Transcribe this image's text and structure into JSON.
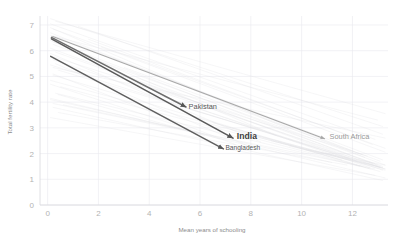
{
  "chart_data": {
    "type": "line",
    "title": "",
    "subtitle": "",
    "xlabel": "Mean years of schooling",
    "ylabel": "Total fertility rate",
    "xlim": [
      -0.3,
      13.4
    ],
    "ylim": [
      0,
      7.35
    ],
    "xticks": [
      0,
      2,
      4,
      6,
      8,
      10,
      12
    ],
    "xtick_labels": [
      "0",
      "2",
      "4",
      "6",
      "8",
      "10",
      "12"
    ],
    "yticks": [
      0,
      1,
      2,
      3,
      4,
      5,
      6,
      7
    ],
    "ytick_labels": [
      "0",
      "1",
      "2",
      "3",
      "4",
      "5",
      "6",
      "7"
    ],
    "grid": true,
    "legend_position": "none",
    "annotations": [
      {
        "text": "Pakistan",
        "x": 5.55,
        "y": 3.75,
        "style": "normal"
      },
      {
        "text": "India",
        "x": 7.45,
        "y": 2.55,
        "style": "strong"
      },
      {
        "text": "Bangladesh",
        "x": 7.0,
        "y": 2.12,
        "style": "small"
      },
      {
        "text": "South Africa",
        "x": 11.1,
        "y": 2.55,
        "style": "faint"
      }
    ],
    "series": [
      {
        "name": "Pakistan",
        "color": "#6e6e6e",
        "width": 1.5,
        "x": [
          0.15,
          5.45
        ],
        "y": [
          6.52,
          3.81
        ],
        "arrow": true
      },
      {
        "name": "India",
        "color": "#5a5a5a",
        "width": 1.6,
        "x": [
          0.15,
          7.3
        ],
        "y": [
          6.46,
          2.6
        ],
        "arrow": true
      },
      {
        "name": "Bangladesh",
        "color": "#5f5f5f",
        "width": 1.5,
        "x": [
          0.12,
          6.92
        ],
        "y": [
          5.78,
          2.18
        ],
        "arrow": true
      },
      {
        "name": "South Africa",
        "color": "#a8a8a8",
        "width": 1.1,
        "x": [
          0.2,
          10.9
        ],
        "y": [
          6.55,
          2.58
        ],
        "arrow": true
      }
    ],
    "background_series_note": "faint grey declining trend lines for many countries",
    "background_series": [
      {
        "x": [
          0.1,
          13.2
        ],
        "y": [
          7.25,
          3.05
        ]
      },
      {
        "x": [
          0.1,
          12.9
        ],
        "y": [
          7.05,
          2.55
        ]
      },
      {
        "x": [
          0.2,
          13.3
        ],
        "y": [
          6.85,
          2.2
        ]
      },
      {
        "x": [
          0.1,
          12.4
        ],
        "y": [
          6.7,
          1.95
        ]
      },
      {
        "x": [
          0.3,
          13.2
        ],
        "y": [
          6.55,
          1.75
        ]
      },
      {
        "x": [
          0.1,
          12.8
        ],
        "y": [
          6.4,
          1.6
        ]
      },
      {
        "x": [
          0.2,
          13.3
        ],
        "y": [
          6.25,
          1.55
        ]
      },
      {
        "x": [
          0.1,
          12.2
        ],
        "y": [
          6.1,
          1.7
        ]
      },
      {
        "x": [
          0.3,
          13.1
        ],
        "y": [
          5.95,
          1.45
        ]
      },
      {
        "x": [
          0.1,
          12.6
        ],
        "y": [
          5.8,
          1.9
        ]
      },
      {
        "x": [
          0.2,
          13.2
        ],
        "y": [
          5.65,
          1.35
        ]
      },
      {
        "x": [
          0.1,
          11.9
        ],
        "y": [
          5.45,
          1.8
        ]
      },
      {
        "x": [
          0.4,
          13.0
        ],
        "y": [
          5.25,
          1.55
        ]
      },
      {
        "x": [
          0.2,
          12.7
        ],
        "y": [
          5.05,
          1.4
        ]
      },
      {
        "x": [
          0.1,
          11.6
        ],
        "y": [
          4.85,
          1.75
        ]
      },
      {
        "x": [
          0.5,
          13.1
        ],
        "y": [
          4.6,
          1.3
        ]
      },
      {
        "x": [
          0.3,
          12.3
        ],
        "y": [
          4.35,
          1.5
        ]
      },
      {
        "x": [
          0.1,
          11.2
        ],
        "y": [
          4.1,
          1.65
        ]
      },
      {
        "x": [
          0.6,
          12.9
        ],
        "y": [
          3.9,
          1.4
        ]
      },
      {
        "x": [
          0.4,
          11.8
        ],
        "y": [
          3.6,
          1.55
        ]
      },
      {
        "x": [
          1.2,
          13.2
        ],
        "y": [
          6.95,
          2.75
        ]
      },
      {
        "x": [
          1.6,
          12.8
        ],
        "y": [
          6.45,
          2.35
        ]
      },
      {
        "x": [
          2.1,
          13.3
        ],
        "y": [
          6.15,
          2.05
        ]
      },
      {
        "x": [
          2.6,
          12.5
        ],
        "y": [
          5.7,
          1.85
        ]
      },
      {
        "x": [
          3.0,
          13.1
        ],
        "y": [
          5.35,
          1.7
        ]
      },
      {
        "x": [
          3.5,
          12.9
        ],
        "y": [
          4.95,
          1.6
        ]
      },
      {
        "x": [
          4.0,
          13.2
        ],
        "y": [
          4.55,
          1.5
        ]
      },
      {
        "x": [
          4.6,
          12.7
        ],
        "y": [
          4.2,
          1.45
        ]
      },
      {
        "x": [
          5.2,
          13.3
        ],
        "y": [
          3.85,
          1.4
        ]
      },
      {
        "x": [
          5.8,
          12.4
        ],
        "y": [
          3.45,
          1.5
        ]
      },
      {
        "x": [
          0.1,
          9.5
        ],
        "y": [
          6.9,
          2.95
        ]
      },
      {
        "x": [
          0.2,
          9.0
        ],
        "y": [
          6.35,
          2.7
        ]
      },
      {
        "x": [
          0.1,
          8.4
        ],
        "y": [
          5.9,
          2.45
        ]
      },
      {
        "x": [
          0.3,
          8.0
        ],
        "y": [
          5.5,
          2.25
        ]
      },
      {
        "x": [
          0.2,
          7.4
        ],
        "y": [
          5.1,
          2.35
        ]
      },
      {
        "x": [
          0.1,
          6.8
        ],
        "y": [
          4.7,
          2.55
        ]
      },
      {
        "x": [
          0.4,
          6.2
        ],
        "y": [
          4.3,
          2.7
        ]
      },
      {
        "x": [
          0.2,
          5.6
        ],
        "y": [
          3.95,
          2.85
        ]
      },
      {
        "x": [
          6.5,
          13.3
        ],
        "y": [
          3.2,
          1.35
        ]
      },
      {
        "x": [
          7.2,
          13.2
        ],
        "y": [
          2.95,
          1.45
        ]
      },
      {
        "x": [
          8.0,
          13.3
        ],
        "y": [
          2.7,
          1.4
        ]
      },
      {
        "x": [
          8.8,
          13.1
        ],
        "y": [
          2.5,
          1.5
        ]
      },
      {
        "x": [
          9.5,
          13.2
        ],
        "y": [
          2.3,
          1.45
        ]
      },
      {
        "x": [
          10.2,
          13.3
        ],
        "y": [
          2.15,
          1.55
        ]
      },
      {
        "x": [
          0.1,
          13.3
        ],
        "y": [
          4.15,
          1.05
        ]
      },
      {
        "x": [
          0.2,
          13.2
        ],
        "y": [
          3.8,
          0.95
        ]
      },
      {
        "x": [
          0.1,
          12.9
        ],
        "y": [
          3.4,
          1.15
        ]
      },
      {
        "x": [
          0.3,
          13.3
        ],
        "y": [
          7.15,
          3.55
        ]
      },
      {
        "x": [
          0.1,
          13.0
        ],
        "y": [
          6.6,
          3.3
        ]
      },
      {
        "x": [
          0.2,
          13.3
        ],
        "y": [
          5.35,
          2.6
        ]
      }
    ]
  }
}
